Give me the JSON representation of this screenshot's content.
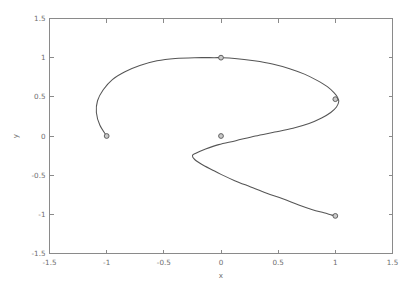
{
  "chart_data": {
    "type": "line",
    "title": "",
    "subtitle": "",
    "xlabel": "x",
    "ylabel": "y",
    "xlim": [
      -1.5,
      1.5
    ],
    "ylim": [
      -1.5,
      1.5
    ],
    "grid": false,
    "legend": null,
    "background": "#ffffff",
    "line_color": "#555555",
    "marker_face_color": "#c9c9c9",
    "marker_edge_color": "#555555",
    "axis_color": "#8a8a8a",
    "tick_label_color": "#6e6e6e",
    "xticks": [
      -1.5,
      -1,
      -0.5,
      0,
      0.5,
      1,
      1.5
    ],
    "xtick_labels": [
      "-1.5",
      "-1",
      "-0.5",
      "0",
      "0.5",
      "1",
      "1.5"
    ],
    "yticks": [
      -1.5,
      -1,
      -0.5,
      0,
      0.5,
      1,
      1.5
    ],
    "ytick_labels": [
      "-1.5",
      "-1",
      "-0.5",
      "0",
      "0.5",
      "1",
      "1.5"
    ],
    "series": [
      {
        "name": "curve",
        "marker": "o",
        "marked_points": [
          {
            "x": -1.0,
            "y": 0.0,
            "label": "start"
          },
          {
            "x": 0.0,
            "y": 1.0,
            "label": "top"
          },
          {
            "x": 1.0,
            "y": 0.47,
            "label": "right"
          },
          {
            "x": 0.0,
            "y": 0.0,
            "label": "center"
          },
          {
            "x": 1.0,
            "y": -1.02,
            "label": "end"
          }
        ],
        "x": [
          -1.0,
          -1.06,
          -1.09,
          -1.08,
          -1.03,
          -0.95,
          -0.84,
          -0.71,
          -0.56,
          -0.4,
          -0.23,
          -0.06,
          0.0,
          0.12,
          0.29,
          0.45,
          0.6,
          0.73,
          0.84,
          0.93,
          0.99,
          1.02,
          1.03,
          1.01,
          0.96,
          0.88,
          0.77,
          0.63,
          0.47,
          0.3,
          0.13,
          -0.02,
          -0.14,
          -0.22,
          -0.25,
          -0.23,
          -0.17,
          -0.08,
          0.0,
          0.12,
          0.26,
          0.4,
          0.54,
          0.68,
          0.8,
          0.9,
          0.97,
          1.0
        ],
        "y": [
          0.0,
          0.14,
          0.3,
          0.45,
          0.59,
          0.72,
          0.82,
          0.9,
          0.96,
          0.99,
          1.0,
          1.0,
          1.0,
          0.99,
          0.96,
          0.92,
          0.86,
          0.79,
          0.71,
          0.63,
          0.55,
          0.49,
          0.44,
          0.37,
          0.3,
          0.23,
          0.16,
          0.1,
          0.05,
          0.0,
          -0.06,
          -0.11,
          -0.17,
          -0.22,
          -0.25,
          -0.3,
          -0.36,
          -0.43,
          -0.49,
          -0.57,
          -0.65,
          -0.73,
          -0.8,
          -0.88,
          -0.94,
          -0.98,
          -1.01,
          -1.02
        ]
      }
    ]
  },
  "axes": {
    "xlabel_text": "x",
    "ylabel_text": "y"
  }
}
